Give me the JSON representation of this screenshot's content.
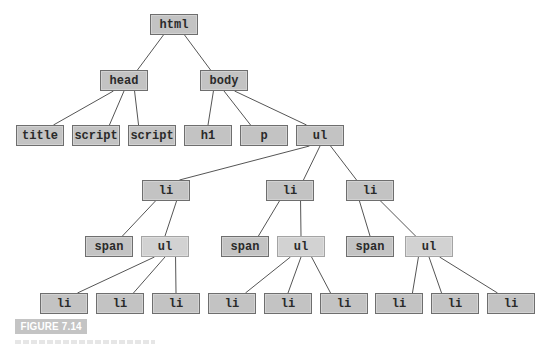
{
  "figure": {
    "label": "FIGURE 7.14",
    "colors": {
      "node_fill": "#c3c3c3",
      "node_fill_light": "#d2d2d2",
      "node_border": "#6e6e6e",
      "edge": "#555555",
      "label_bg": "#c4c4c4"
    }
  },
  "tree": {
    "root": "html",
    "nodes": [
      {
        "id": "html",
        "label": "html",
        "x": 150,
        "y": 14,
        "parent": null
      },
      {
        "id": "head",
        "label": "head",
        "x": 100,
        "y": 70,
        "parent": "html"
      },
      {
        "id": "body",
        "label": "body",
        "x": 200,
        "y": 70,
        "parent": "html"
      },
      {
        "id": "title",
        "label": "title",
        "x": 16,
        "y": 125,
        "parent": "head"
      },
      {
        "id": "script1",
        "label": "script",
        "x": 72,
        "y": 125,
        "parent": "head"
      },
      {
        "id": "script2",
        "label": "script",
        "x": 128,
        "y": 125,
        "parent": "head"
      },
      {
        "id": "h1",
        "label": "h1",
        "x": 184,
        "y": 125,
        "parent": "body"
      },
      {
        "id": "p",
        "label": "p",
        "x": 240,
        "y": 125,
        "parent": "body"
      },
      {
        "id": "ul",
        "label": "ul",
        "x": 296,
        "y": 125,
        "parent": "body"
      },
      {
        "id": "li1",
        "label": "li",
        "x": 142,
        "y": 180,
        "parent": "ul"
      },
      {
        "id": "li2",
        "label": "li",
        "x": 266,
        "y": 180,
        "parent": "ul"
      },
      {
        "id": "li3",
        "label": "li",
        "x": 346,
        "y": 180,
        "parent": "ul"
      },
      {
        "id": "span1",
        "label": "span",
        "x": 85,
        "y": 236,
        "parent": "li1"
      },
      {
        "id": "ul1",
        "label": "ul",
        "x": 141,
        "y": 236,
        "parent": "li1",
        "light": true
      },
      {
        "id": "span2",
        "label": "span",
        "x": 221,
        "y": 236,
        "parent": "li2"
      },
      {
        "id": "ul2",
        "label": "ul",
        "x": 277,
        "y": 236,
        "parent": "li2",
        "light": true
      },
      {
        "id": "span3",
        "label": "span",
        "x": 346,
        "y": 236,
        "parent": "li3"
      },
      {
        "id": "ul3",
        "label": "ul",
        "x": 405,
        "y": 236,
        "parent": "li3",
        "light": true
      },
      {
        "id": "li1a",
        "label": "li",
        "x": 40,
        "y": 293,
        "parent": "ul1"
      },
      {
        "id": "li1b",
        "label": "li",
        "x": 96,
        "y": 293,
        "parent": "ul1"
      },
      {
        "id": "li1c",
        "label": "li",
        "x": 152,
        "y": 293,
        "parent": "ul1"
      },
      {
        "id": "li2a",
        "label": "li",
        "x": 208,
        "y": 293,
        "parent": "ul2"
      },
      {
        "id": "li2b",
        "label": "li",
        "x": 264,
        "y": 293,
        "parent": "ul2"
      },
      {
        "id": "li2c",
        "label": "li",
        "x": 320,
        "y": 293,
        "parent": "ul2"
      },
      {
        "id": "li3a",
        "label": "li",
        "x": 375,
        "y": 293,
        "parent": "ul3"
      },
      {
        "id": "li3b",
        "label": "li",
        "x": 431,
        "y": 293,
        "parent": "ul3"
      },
      {
        "id": "li3c",
        "label": "li",
        "x": 487,
        "y": 293,
        "parent": "ul3"
      }
    ]
  }
}
